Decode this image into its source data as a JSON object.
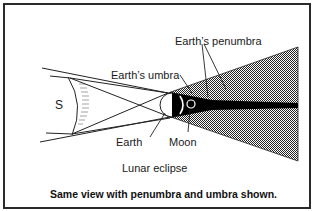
{
  "diagram": {
    "title": "Lunar eclipse",
    "caption": "Same view with penumbra and umbra shown.",
    "labels": {
      "sun": "S",
      "earth_penumbra": "Earth’s penumbra",
      "earth_umbra": "Earth’s umbra",
      "earth": "Earth",
      "moon": "Moon"
    },
    "colors": {
      "ink": "#1a1a1a",
      "umbra": "#000000",
      "penumbra_pattern": "#555555",
      "background": "#ffffff"
    }
  }
}
